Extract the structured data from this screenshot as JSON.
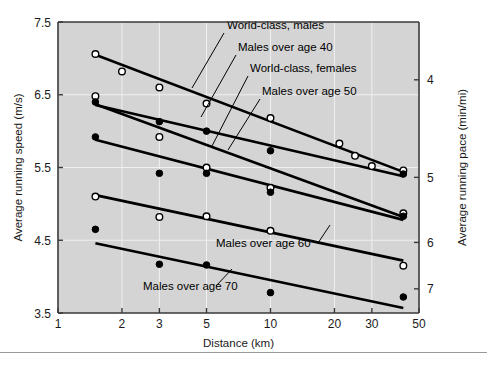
{
  "figure": {
    "background": "#ffffff",
    "plot_background": "#d4d4d4",
    "axis_color": "#3a3a3a",
    "gridline_color": "#f0f0f0",
    "series_color": "#000000",
    "marker_open_fill": "#ffffff"
  },
  "chart_data": {
    "type": "scatter",
    "title": "",
    "xlabel": "Distance (km)",
    "ylabel": "Average running speed (m/s)",
    "y2label": "Average running pace (min/mi)",
    "xscale": "log",
    "xlim": [
      1,
      50
    ],
    "ylim": [
      3.5,
      7.5
    ],
    "xticks": [
      1,
      2,
      3,
      5,
      10,
      20,
      30,
      50
    ],
    "xticklabels": [
      "1",
      "2",
      "3",
      "5",
      "10",
      "20",
      "30",
      "50"
    ],
    "yticks": [
      3.5,
      4.5,
      5.5,
      6.5,
      7.5
    ],
    "yticklabels": [
      "3.5",
      "4.5",
      "5.5",
      "6.5",
      "7.5"
    ],
    "y2ticks_pace": [
      4,
      5,
      6,
      7
    ],
    "y2ticklabels": [
      "4",
      "5",
      "6",
      "7"
    ],
    "grid": true,
    "legend": "annotated-with-leader-lines",
    "series": [
      {
        "name": "World-class, males",
        "marker": "open-circle",
        "points": [
          {
            "x": 1.5,
            "y": 7.06
          },
          {
            "x": 2.0,
            "y": 6.82
          },
          {
            "x": 3.0,
            "y": 6.6
          },
          {
            "x": 5.0,
            "y": 6.38
          },
          {
            "x": 10.0,
            "y": 6.18
          },
          {
            "x": 21.1,
            "y": 5.83
          },
          {
            "x": 25.0,
            "y": 5.66
          },
          {
            "x": 30.0,
            "y": 5.52
          },
          {
            "x": 42.2,
            "y": 5.46
          }
        ],
        "fit": {
          "x1": 1.5,
          "y1": 7.05,
          "x2": 42.2,
          "y2": 5.44
        }
      },
      {
        "name": "Males over age 40",
        "marker": "open-circle",
        "points": [
          {
            "x": 1.5,
            "y": 6.48
          },
          {
            "x": 3.0,
            "y": 5.92
          },
          {
            "x": 5.0,
            "y": 5.5
          },
          {
            "x": 10.0,
            "y": 5.22
          },
          {
            "x": 42.2,
            "y": 4.87
          }
        ],
        "fit": {
          "x1": 1.5,
          "y1": 6.37,
          "x2": 42.2,
          "y2": 4.82
        }
      },
      {
        "name": "World-class, females",
        "marker": "filled-circle",
        "points": [
          {
            "x": 1.5,
            "y": 6.4
          },
          {
            "x": 3.0,
            "y": 6.13
          },
          {
            "x": 5.0,
            "y": 6.0
          },
          {
            "x": 10.0,
            "y": 5.73
          },
          {
            "x": 42.2,
            "y": 5.41
          }
        ],
        "fit": {
          "x1": 1.5,
          "y1": 6.36,
          "x2": 42.2,
          "y2": 5.38
        }
      },
      {
        "name": "Males over age 50",
        "marker": "filled-circle",
        "points": [
          {
            "x": 1.5,
            "y": 5.92
          },
          {
            "x": 3.0,
            "y": 5.42
          },
          {
            "x": 5.0,
            "y": 5.42
          },
          {
            "x": 10.0,
            "y": 5.16
          },
          {
            "x": 42.2,
            "y": 4.83
          }
        ],
        "fit": {
          "x1": 1.5,
          "y1": 5.88,
          "x2": 42.2,
          "y2": 4.78
        }
      },
      {
        "name": "Males over age 60",
        "marker": "open-circle",
        "points": [
          {
            "x": 1.5,
            "y": 5.1
          },
          {
            "x": 3.0,
            "y": 4.82
          },
          {
            "x": 5.0,
            "y": 4.83
          },
          {
            "x": 10.0,
            "y": 4.63
          },
          {
            "x": 42.2,
            "y": 4.15
          }
        ],
        "fit": {
          "x1": 1.5,
          "y1": 5.12,
          "x2": 42.2,
          "y2": 4.22
        }
      },
      {
        "name": "Males over age 70",
        "marker": "filled-circle",
        "points": [
          {
            "x": 1.5,
            "y": 4.65
          },
          {
            "x": 3.0,
            "y": 4.17
          },
          {
            "x": 5.0,
            "y": 4.16
          },
          {
            "x": 10.0,
            "y": 3.78
          },
          {
            "x": 42.2,
            "y": 3.72
          }
        ],
        "fit": {
          "x1": 1.5,
          "y1": 4.46,
          "x2": 42.2,
          "y2": 3.57
        }
      }
    ],
    "annotations": [
      {
        "text": "World-class, males",
        "tx": 227,
        "ty": 29,
        "lx1": 224,
        "ly1": 33,
        "lx2": 192,
        "ly2": 88
      },
      {
        "text": "Males over age 40",
        "tx": 238,
        "ty": 51,
        "lx1": 236,
        "ly1": 55,
        "lx2": 201,
        "ly2": 117
      },
      {
        "text": "World-class, females",
        "tx": 250,
        "ty": 72,
        "lx1": 248,
        "ly1": 76,
        "lx2": 212,
        "ly2": 146
      },
      {
        "text": "Males over age 50",
        "tx": 262,
        "ty": 95,
        "lx1": 260,
        "ly1": 99,
        "lx2": 228,
        "ly2": 150
      },
      {
        "text": "Males over age 60",
        "tx": 216,
        "ty": 247,
        "lx1": 318,
        "ly1": 243,
        "lx2": 330,
        "ly2": 225
      },
      {
        "text": "Males over age 70",
        "tx": 143,
        "ty": 290,
        "lx1": 216,
        "ly1": 286,
        "lx2": 232,
        "ly2": 269
      }
    ]
  }
}
